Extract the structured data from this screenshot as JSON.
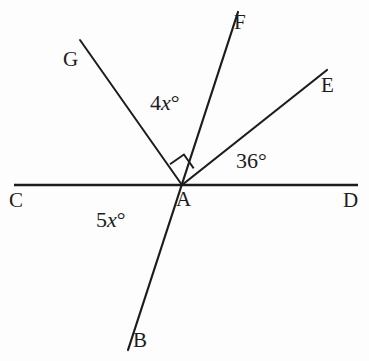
{
  "figure": {
    "type": "geometry-angle-diagram",
    "background_color": "#fdfdfd",
    "line_color": "#1c1c1c",
    "text_color": "#1c1c1c"
  },
  "points": {
    "A": {
      "label": "A",
      "x": 182,
      "y": 185,
      "role": "vertex"
    },
    "B": {
      "label": "B",
      "x": 128,
      "y": 350,
      "role": "ray-endpoint"
    },
    "C": {
      "label": "C",
      "x": 14,
      "y": 185,
      "role": "line-endpoint"
    },
    "D": {
      "label": "D",
      "x": 358,
      "y": 185,
      "role": "line-endpoint"
    },
    "E": {
      "label": "E",
      "x": 327,
      "y": 70,
      "role": "ray-endpoint"
    },
    "F": {
      "label": "F",
      "x": 238,
      "y": 12,
      "role": "ray-endpoint"
    },
    "G": {
      "label": "G",
      "x": 80,
      "y": 40,
      "role": "ray-endpoint"
    }
  },
  "segments": [
    {
      "name": "line-CD",
      "from": "C",
      "to": "D",
      "kind": "straight-line"
    },
    {
      "name": "line-FB",
      "from": "F",
      "to": "B",
      "kind": "straight-line"
    },
    {
      "name": "ray-AG",
      "from": "A",
      "to": "G",
      "kind": "ray"
    },
    {
      "name": "ray-AE",
      "from": "A",
      "to": "E",
      "kind": "ray"
    }
  ],
  "angle_labels": [
    {
      "name": "angle-GAF",
      "between": [
        "AG",
        "AF"
      ],
      "text": "4x°",
      "coefficient": "4",
      "variable": "x",
      "unit": "°"
    },
    {
      "name": "angle-EAD",
      "between": [
        "AE",
        "AD"
      ],
      "text": "36°",
      "value": "36",
      "unit": "°"
    },
    {
      "name": "angle-CAB",
      "between": [
        "AC",
        "AB"
      ],
      "text": "5x°",
      "coefficient": "5",
      "variable": "x",
      "unit": "°"
    }
  ],
  "markers": [
    {
      "name": "right-angle-mark",
      "at": "A",
      "between": [
        "AG",
        "AF"
      ],
      "kind": "right-angle-square"
    }
  ],
  "labels": {
    "A": "A",
    "B": "B",
    "C": "C",
    "D": "D",
    "E": "E",
    "F": "F",
    "G": "G",
    "angle_4x_coef": "4",
    "angle_4x_var": "x",
    "angle_4x_deg": "°",
    "angle_36": "36°",
    "angle_5x_coef": "5",
    "angle_5x_var": "x",
    "angle_5x_deg": "°"
  }
}
